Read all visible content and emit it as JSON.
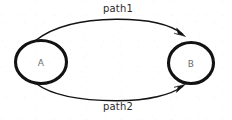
{
  "diagram": {
    "kind": "directed-graph",
    "background_color": "#ffffff",
    "stroke_color": "#141414",
    "node_label_color": "#6d6d6d",
    "edge_label_color": "#2a2a2a",
    "width": 232,
    "height": 120,
    "nodes": [
      {
        "id": "A",
        "label": "A",
        "shape": "ellipse",
        "cx": 41,
        "cy": 62,
        "rx": 26,
        "ry": 22
      },
      {
        "id": "B",
        "label": "B",
        "shape": "ellipse",
        "cx": 191,
        "cy": 63,
        "rx": 23,
        "ry": 21
      }
    ],
    "edges": [
      {
        "id": "path1",
        "label": "path1",
        "from": "A",
        "to": "B",
        "direction": "A-to-B",
        "routing": "arc-above",
        "arrowhead": "at-target"
      },
      {
        "id": "path2",
        "label": "path2",
        "from": "A",
        "to": "B",
        "direction": "A-to-B",
        "routing": "arc-below",
        "arrowhead": "at-target"
      }
    ]
  }
}
